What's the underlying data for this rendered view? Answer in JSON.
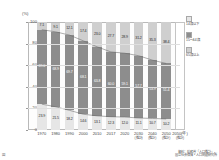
{
  "chart_data": {
    "type": "bar",
    "title": "",
    "subtitle": "",
    "xlabel": "(年)",
    "ylabel": "(%)",
    "ylim": [
      0,
      100
    ],
    "yticks": [
      0,
      20,
      40,
      60,
      80,
      100
    ],
    "grid": true,
    "legend_position": "right",
    "stacked": true,
    "categories": [
      "1970",
      "1980",
      "1990",
      "2000",
      "2010",
      "2017",
      "2020",
      "2030",
      "2040",
      "2050"
    ],
    "category_sublabels": [
      "",
      "",
      "",
      "",
      "",
      "",
      "",
      "(推計)",
      "(推計)",
      "(推計)"
    ],
    "series": [
      {
        "name": "65歳以上",
        "color": "#cfcfcf",
        "values": [
          7.1,
          9.1,
          12.1,
          17.4,
          23.0,
          27.7,
          28.9,
          31.2,
          35.3,
          38.4
        ]
      },
      {
        "name": "15〜64歳",
        "color": "#8d8d8d",
        "values": [
          69.0,
          68.9,
          69.7,
          68.1,
          63.8,
          60.0,
          59.1,
          57.7,
          53.9,
          51.4
        ]
      },
      {
        "name": "14歳以下",
        "color": "#e6e6e6",
        "values": [
          23.9,
          21.5,
          18.2,
          14.6,
          13.1,
          12.3,
          12.0,
          11.1,
          10.7,
          10.2
        ]
      }
    ],
    "trend_lines": [
      {
        "name": "65歳以上累積境界",
        "values": [
          92.9,
          90.9,
          87.9,
          82.6,
          77.0,
          72.3,
          71.1,
          68.8,
          64.7,
          61.6
        ]
      },
      {
        "name": "14歳以下境界",
        "values": [
          23.9,
          21.5,
          18.2,
          14.6,
          13.1,
          12.3,
          12.0,
          11.1,
          10.7,
          10.2
        ]
      }
    ],
    "annotations": {
      "future_marker_label": "2050(年)",
      "future_marker_sub": "(推計)"
    }
  },
  "axis": {
    "y_unit": "(%)",
    "x_unit": "(年)",
    "yticks": [
      "0",
      "20",
      "40",
      "60",
      "80",
      "100"
    ]
  },
  "legend": {
    "items": [
      {
        "label": "14歳以下",
        "color": "#e6e6e6"
      },
      {
        "label": "15〜64歳",
        "color": "#8d8d8d"
      },
      {
        "label": "65歳以上",
        "color": "#cfcfcf"
      }
    ]
  },
  "footer": {
    "source": "資料：総務省「人口推計」、",
    "source2": "国立社会保障・人口問題研究所",
    "corner": "図"
  }
}
